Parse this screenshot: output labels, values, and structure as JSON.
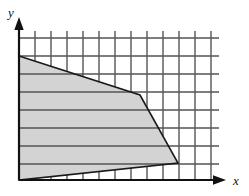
{
  "figure": {
    "title": "",
    "width": 249,
    "height": 196,
    "background_color": "#ffffff"
  },
  "axes": {
    "x_axis": {
      "label": "x",
      "icon": "arrow-right-icon",
      "start_x": 19,
      "end_x": 222,
      "y": 180,
      "color": "#111111",
      "label_x": 233,
      "label_y": 184
    },
    "y_axis": {
      "label": "y",
      "icon": "arrow-up-icon",
      "x": 19,
      "start_y": 180,
      "end_y": 22,
      "color": "#111111",
      "label_x": 11,
      "label_y": 17
    }
  },
  "grid": {
    "color": "#555555",
    "line_width": 1.4,
    "vertical_lines_x": [
      19,
      35,
      51,
      67,
      83,
      99,
      115,
      131,
      147,
      163,
      179,
      195,
      211
    ],
    "horizontal_lines_y": [
      38,
      56,
      74,
      92,
      110,
      128,
      146,
      164
    ],
    "vertical_top_y": 31,
    "vertical_bottom_y": 180,
    "horizontal_left_x": 19,
    "horizontal_right_x": 219
  },
  "region": {
    "name": "shaded-feasible-region",
    "fill_color": "#d3d3d3",
    "stroke_color": "#1a1a1a",
    "stroke_width": 1.6,
    "vertices": [
      {
        "x": 19,
        "y": 56
      },
      {
        "x": 140,
        "y": 95
      },
      {
        "x": 178,
        "y": 163
      },
      {
        "x": 19,
        "y": 180
      }
    ],
    "vertices_text": "(19,56) (140,95) (178,163) (19,180)"
  },
  "chart_data": {
    "type": "area",
    "title": "",
    "xlabel": "x",
    "ylabel": "y",
    "grid": true,
    "legend": "none",
    "xlim": [
      0,
      12
    ],
    "ylim": [
      0,
      8
    ],
    "x_tick_labels": [],
    "y_tick_labels": [],
    "x_gridline_values": [
      0,
      1,
      2,
      3,
      4,
      5,
      6,
      7,
      8,
      9,
      10,
      11,
      12
    ],
    "y_gridline_values": [
      0,
      1,
      2,
      3,
      4,
      5,
      6,
      7,
      8
    ],
    "series": [
      {
        "name": "shaded region",
        "type": "polygon",
        "closed": true,
        "fill": "#d3d3d3",
        "x": [
          0.0,
          7.56,
          9.94,
          0.0
        ],
        "y": [
          6.89,
          4.72,
          0.94,
          0.0
        ]
      }
    ],
    "annotations": []
  }
}
